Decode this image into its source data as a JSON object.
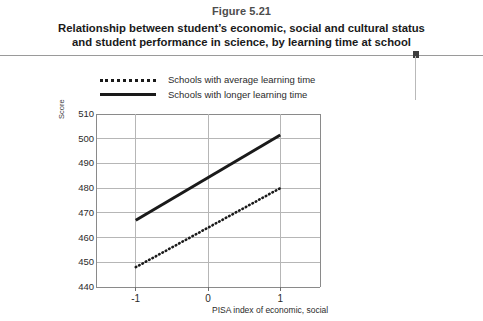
{
  "figure": {
    "number": "Figure 5.21",
    "title_line1": "Relationship between student’s economic, social and cultural status",
    "title_line2": "and student performance in science, by learning time at school"
  },
  "legend": {
    "items": [
      {
        "label": "Schools with average learning time",
        "style": "dotted",
        "color": "#1a1a1a"
      },
      {
        "label": "Schools with longer learning time",
        "style": "solid",
        "color": "#1a1a1a"
      }
    ]
  },
  "chart_data": {
    "type": "line",
    "title": "Relationship between student’s economic, social and cultural status and student performance in science, by learning time at school",
    "xlabel": "PISA index of economic, social",
    "ylabel": "Score",
    "x": [
      -1,
      1
    ],
    "xlim": [
      -1.55,
      1.55
    ],
    "ylim": [
      440,
      510
    ],
    "xticks": [
      "-1",
      "0",
      "1"
    ],
    "xtick_values": [
      -1,
      0,
      1
    ],
    "yticks": [
      "440",
      "450",
      "460",
      "470",
      "480",
      "490",
      "500",
      "510"
    ],
    "ytick_values": [
      440,
      450,
      460,
      470,
      480,
      490,
      500,
      510
    ],
    "grid": true,
    "legend_position": "top-left",
    "series": [
      {
        "name": "Schools with average learning time",
        "style": "dotted",
        "color": "#1a1a1a",
        "x": [
          -1,
          1
        ],
        "values": [
          448,
          480
        ]
      },
      {
        "name": "Schools with longer learning time",
        "style": "solid",
        "color": "#1a1a1a",
        "x": [
          -1,
          1
        ],
        "values": [
          467,
          501.5
        ]
      }
    ]
  }
}
